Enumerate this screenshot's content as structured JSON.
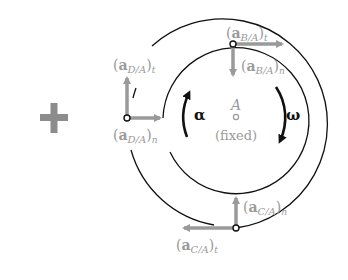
{
  "diagram": {
    "operator": "+",
    "center": {
      "label": "A",
      "note": "(fixed)"
    },
    "angular": {
      "alpha": "α",
      "omega": "ω"
    },
    "points": {
      "B": {
        "tangential": {
          "base": "a",
          "sub": "B/A",
          "suffix": "t"
        },
        "normal": {
          "base": "a",
          "sub": "B/A",
          "suffix": "n"
        }
      },
      "C": {
        "tangential": {
          "base": "a",
          "sub": "C/A",
          "suffix": "t"
        },
        "normal": {
          "base": "a",
          "sub": "C/A",
          "suffix": "n"
        }
      },
      "D": {
        "tangential": {
          "base": "a",
          "sub": "D/A",
          "suffix": "t"
        },
        "normal": {
          "base": "a",
          "sub": "D/A",
          "suffix": "n"
        }
      }
    },
    "colors": {
      "vector": "#9a9a9a",
      "line": "#111111",
      "label": "#9a9a9a"
    }
  }
}
